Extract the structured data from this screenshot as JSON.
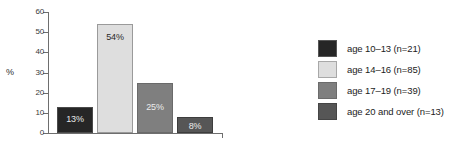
{
  "chart_data": {
    "type": "bar",
    "title": "",
    "xlabel": "",
    "ylabel": "%",
    "ylim": [
      0,
      60
    ],
    "yticks": [
      "0",
      "10",
      "20",
      "30",
      "40",
      "50",
      "60"
    ],
    "grid": false,
    "legend_position": "right",
    "categories": [
      "age 10–13 (n=21)",
      "age 14–16 (n=85)",
      "age 17–19 (n=39)",
      "age 20 and over (n=13)"
    ],
    "values": [
      13,
      54,
      25,
      8
    ],
    "data_labels": [
      "13%",
      "54%",
      "25%",
      "8%"
    ],
    "colors": [
      "#262626",
      "#dedede",
      "#7f7f7f",
      "#565656"
    ],
    "label_colors": [
      "#e8e8e8",
      "#2a2a2a",
      "#ececec",
      "#ececec"
    ],
    "bar_border_colors": [
      "#4a4a4a",
      "#9a9a9a",
      "#6a6a6a",
      "#3d3d3d"
    ]
  },
  "axis": {
    "y_title": "%",
    "ticks": [
      {
        "label": "60",
        "value": 60
      },
      {
        "label": "50",
        "value": 50
      },
      {
        "label": "40",
        "value": 40
      },
      {
        "label": "30",
        "value": 30
      },
      {
        "label": "20",
        "value": 20
      },
      {
        "label": "10",
        "value": 10
      },
      {
        "label": "0",
        "value": 0
      }
    ]
  },
  "legend": {
    "items": [
      {
        "label": "age 10–13 (n=21)",
        "color": "#262626",
        "swatch_border": "#555555"
      },
      {
        "label": "age 14–16 (n=85)",
        "color": "#dedede",
        "swatch_border": "#a8a8a8"
      },
      {
        "label": "age 17–19 (n=39)",
        "color": "#7f7f7f",
        "swatch_border": "#6b6b6b"
      },
      {
        "label": "age 20 and over (n=13)",
        "color": "#565656",
        "swatch_border": "#454545"
      }
    ]
  }
}
